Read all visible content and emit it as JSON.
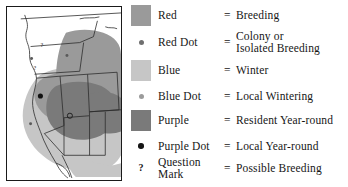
{
  "figure": {
    "kind": "range-map-legend",
    "background": "#ffffff"
  },
  "map": {
    "name": "western-united-states-range-map",
    "border_color": "#1a1a1a",
    "land_color": "#ffffff",
    "state_line_color": "#2b2b2b",
    "shading": {
      "breeding_red": "#9a9a9a",
      "winter_blue": "#c4c4c4",
      "resident_purple": "#7b7b7b"
    },
    "markers": [
      {
        "type": "question-mark",
        "label": "?",
        "x": 35,
        "y": 38
      },
      {
        "type": "question-mark",
        "label": "?",
        "x": 28,
        "y": 62
      },
      {
        "type": "red-dot",
        "label": "",
        "x": 25,
        "y": 52
      },
      {
        "type": "red-dot",
        "label": "",
        "x": 61,
        "y": 49
      },
      {
        "type": "purple-dot",
        "label": "",
        "x": 34,
        "y": 90
      },
      {
        "type": "red-dot-circle",
        "label": "",
        "x": 64,
        "y": 110
      },
      {
        "type": "red-dot",
        "label": "",
        "x": 24,
        "y": 118
      }
    ]
  },
  "legend": {
    "title": "",
    "colors": {
      "red": "#9a9a9a",
      "red_dot": "#6f6f6f",
      "blue": "#c6c6c6",
      "blue_dot": "#9b9b9b",
      "purple": "#7a7a7a",
      "purple_dot": "#151515",
      "question_mark": "#111111"
    },
    "equals": "=",
    "rows": [
      {
        "symbol": "red-swatch",
        "symbol_kind": "swatch",
        "term": "Red",
        "equals": "=",
        "description": "Breeding",
        "description_lines": [
          "Breeding"
        ]
      },
      {
        "symbol": "red-dot",
        "symbol_kind": "dot",
        "term": "Red Dot",
        "equals": "=",
        "description": "Colony or Isolated Breeding",
        "description_lines": [
          "Colony or",
          "Isolated Breeding"
        ]
      },
      {
        "symbol": "blue-swatch",
        "symbol_kind": "swatch",
        "term": "Blue",
        "equals": "=",
        "description": "Winter",
        "description_lines": [
          "Winter"
        ]
      },
      {
        "symbol": "blue-dot",
        "symbol_kind": "dot",
        "term": "Blue Dot",
        "equals": "=",
        "description": "Local Wintering",
        "description_lines": [
          "Local Wintering"
        ]
      },
      {
        "symbol": "purple-swatch",
        "symbol_kind": "swatch",
        "term": "Purple",
        "equals": "=",
        "description": "Resident Year-round",
        "description_lines": [
          "Resident Year-round"
        ]
      },
      {
        "symbol": "purple-dot",
        "symbol_kind": "dot",
        "term": "Purple Dot",
        "equals": "=",
        "description": "Local Year-round",
        "description_lines": [
          "Local Year-round"
        ]
      },
      {
        "symbol": "question-mark",
        "symbol_kind": "glyph",
        "symbol_glyph": "?",
        "term": "Question Mark",
        "term_lines": [
          "Question",
          "Mark"
        ],
        "equals": "=",
        "description": "Possible Breeding",
        "description_lines": [
          "Possible Breeding"
        ]
      }
    ]
  }
}
